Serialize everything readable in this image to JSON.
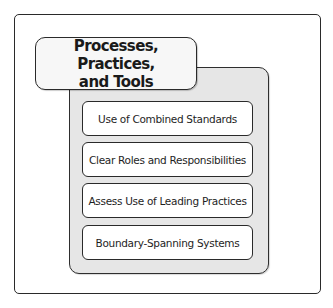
{
  "diagram": {
    "title": "Processes, Practices, and Tools",
    "title_lines": [
      "Processes, Practices,",
      "and Tools"
    ],
    "items": [
      {
        "label": "Use of Combined Standards"
      },
      {
        "label": "Clear Roles and Responsibilities"
      },
      {
        "label": "Assess Use of Leading Practices"
      },
      {
        "label": "Boundary-Spanning Systems"
      }
    ]
  },
  "colors": {
    "panel_fill": "#e6e6e6",
    "border": "#2a2a2a",
    "box_fill": "#ffffff"
  }
}
